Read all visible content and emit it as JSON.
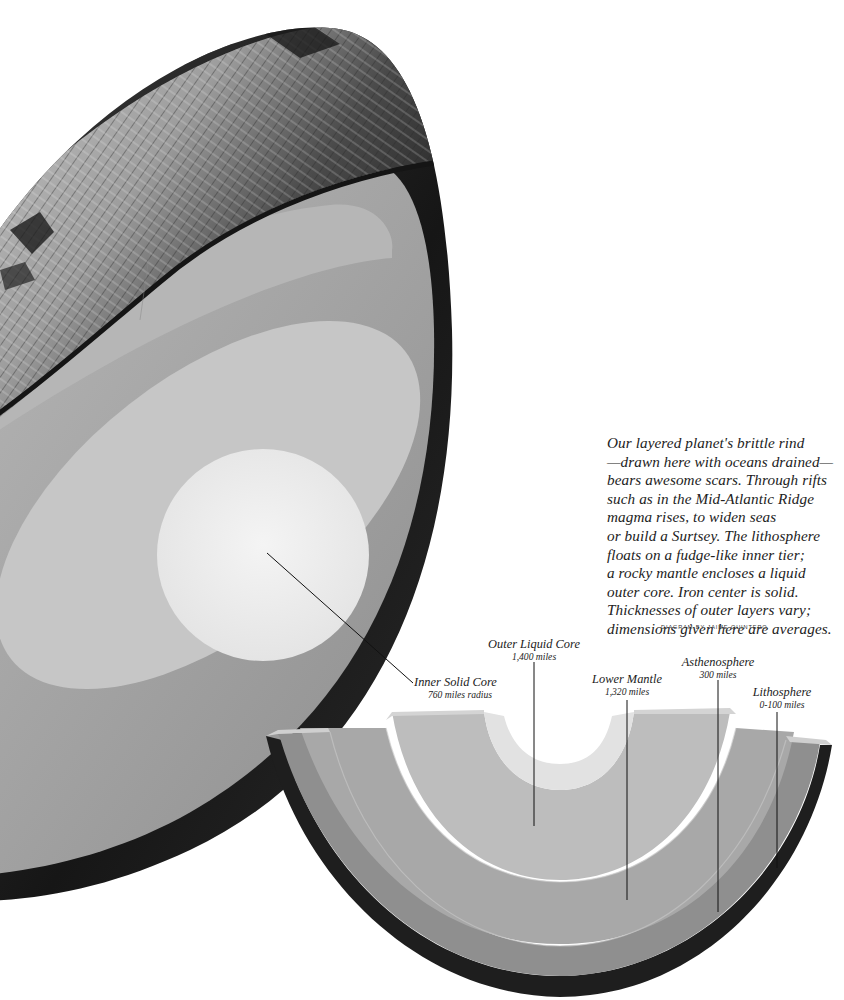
{
  "figure": {
    "type": "cutaway-earth-diagram",
    "caption_lines": [
      "Our layered planet's brittle rind",
      "—drawn here with oceans drained—",
      "bears awesome scars. Through rifts",
      "such as in the Mid-Atlantic Ridge",
      "magma rises, to widen seas",
      "or build a Surtsey. The lithosphere",
      "floats on a fudge-like inner tier;",
      "a rocky mantle encloses a liquid",
      "outer core. Iron center is solid.",
      "Thicknesses of outer layers vary;",
      "dimensions given here are averages."
    ],
    "credit": "DIAGRAM BY JAIME QUINTERO"
  },
  "labels": {
    "inner_core": {
      "name": "Inner Solid Core",
      "value": "760 miles radius"
    },
    "outer_core": {
      "name": "Outer Liquid Core",
      "value": "1,400 miles"
    },
    "lower_mantle": {
      "name": "Lower Mantle",
      "value": "1,320 miles"
    },
    "asthenosphere": {
      "name": "Asthenosphere",
      "value": "300 miles"
    },
    "lithosphere": {
      "name": "Lithosphere",
      "value": "0-100 miles"
    }
  },
  "colors": {
    "background": "#ffffff",
    "crust_rim": "#1a1a1a",
    "mantle": "#9a9a9a",
    "upper_mantle_band": "#b4b4b4",
    "outer_core": "#c9c9c9",
    "inner_core": "#ececec",
    "terrain_light": "#d8d8d8",
    "terrain_dark": "#2a2a2a",
    "leader_line": "#111111",
    "text": "#222222"
  }
}
